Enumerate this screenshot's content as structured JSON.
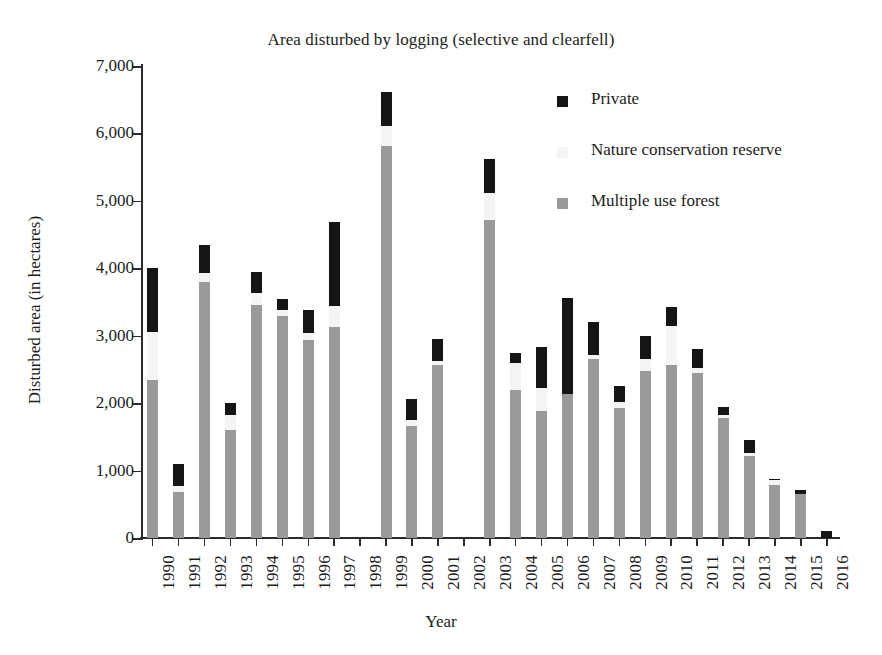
{
  "chart_data": {
    "type": "bar",
    "stacked": true,
    "title": "Area disturbed by logging (selective and clearfell)",
    "xlabel": "Year",
    "ylabel": "Disturbed area (in hectares)",
    "grid": false,
    "legend_position": "upper-right-inside",
    "ylim": [
      0,
      7000
    ],
    "ytick_labels": [
      "0",
      "1,000",
      "2,000",
      "3,000",
      "4,000",
      "5,000",
      "6,000",
      "7,000"
    ],
    "ytick_values": [
      0,
      1000,
      2000,
      3000,
      4000,
      5000,
      6000,
      7000
    ],
    "categories": [
      "1990",
      "1991",
      "1992",
      "1993",
      "1994",
      "1995",
      "1996",
      "1997",
      "1998",
      "1999",
      "2000",
      "2001",
      "2002",
      "2003",
      "2004",
      "2005",
      "2006",
      "2007",
      "2008",
      "2009",
      "2010",
      "2011",
      "2012",
      "2013",
      "2014",
      "2015",
      "2016"
    ],
    "series": [
      {
        "name": "Multiple use forest",
        "color": "#9a9a9a",
        "values": [
          2350,
          680,
          3800,
          1600,
          3450,
          3300,
          2930,
          3130,
          0,
          5820,
          1660,
          2570,
          0,
          4720,
          2200,
          1880,
          2140,
          2650,
          1930,
          2480,
          2560,
          2450,
          1780,
          1210,
          790,
          650,
          0
        ]
      },
      {
        "name": "Nature conservation reserve",
        "color": "#f4f4f2",
        "values": [
          700,
          90,
          130,
          220,
          190,
          80,
          110,
          310,
          0,
          290,
          90,
          60,
          0,
          390,
          390,
          350,
          0,
          60,
          80,
          180,
          590,
          70,
          50,
          50,
          70,
          0,
          0
        ]
      },
      {
        "name": "Private",
        "color": "#151515",
        "values": [
          960,
          330,
          410,
          180,
          310,
          170,
          340,
          1240,
          0,
          510,
          310,
          320,
          0,
          510,
          160,
          610,
          1420,
          500,
          250,
          340,
          270,
          290,
          110,
          200,
          10,
          60,
          110
        ]
      }
    ],
    "totals": [
      4010,
      1100,
      4340,
      2000,
      3950,
      3550,
      3380,
      4680,
      0,
      6620,
      2060,
      2950,
      0,
      5620,
      2750,
      2840,
      3560,
      3210,
      2260,
      3000,
      3420,
      2810,
      1940,
      1460,
      870,
      710,
      110
    ],
    "missing_years": [
      "1998",
      "2002"
    ]
  },
  "legend": {
    "items": [
      {
        "label": "Private",
        "color": "#151515"
      },
      {
        "label": "Nature conservation reserve",
        "color": "#f4f4f2"
      },
      {
        "label": "Multiple use forest",
        "color": "#9a9a9a"
      }
    ]
  }
}
